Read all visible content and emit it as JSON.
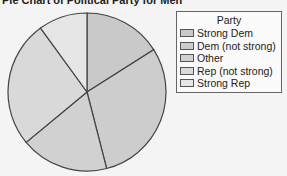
{
  "chart_data": {
    "type": "pie",
    "title": "Pie Chart of Political Party for Men",
    "legend_title": "Party",
    "legend_position": "right",
    "categories": [
      "Strong Dem",
      "Dem (not strong)",
      "Other",
      "Rep (not strong)",
      "Strong Rep"
    ],
    "values": [
      16,
      30,
      18,
      26,
      10
    ],
    "value_unit": "percent (estimated from slice angles)",
    "colors": [
      "#c9c9c9",
      "#cdcdcd",
      "#d1d1d1",
      "#d9d9d9",
      "#e6e6e6"
    ],
    "start_angle_deg": 0,
    "direction": "clockwise"
  }
}
